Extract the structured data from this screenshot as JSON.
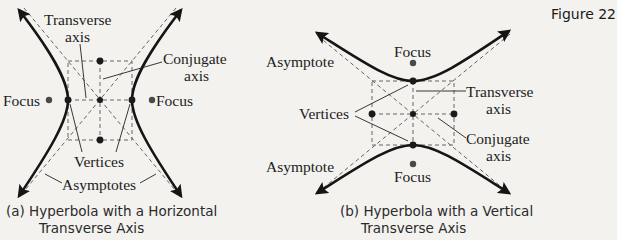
{
  "figure_label": "Figure 22",
  "panel_a": {
    "caption_line1": "(a) Hyperbola with a Horizontal",
    "caption_line2": "Transverse Axis",
    "labels": {
      "transverse_1": "Transverse",
      "transverse_2": "axis",
      "conjugate_1": "Conjugate",
      "conjugate_2": "axis",
      "focus_left": "Focus",
      "focus_right": "Focus",
      "vertices": "Vertices",
      "asymptotes": "Asymptotes"
    }
  },
  "panel_b": {
    "caption_line1": "(b) Hyperbola with a Vertical",
    "caption_line2": "Transverse Axis",
    "labels": {
      "focus_top": "Focus",
      "focus_bottom": "Focus",
      "asymptote_top": "Asymptote",
      "asymptote_bottom": "Asymptote",
      "vertices": "Vertices",
      "transverse_1": "Transverse",
      "transverse_2": "axis",
      "conjugate_1": "Conjugate",
      "conjugate_2": "axis"
    }
  },
  "colors": {
    "background": "#f3f2ef",
    "ink": "#151515"
  }
}
